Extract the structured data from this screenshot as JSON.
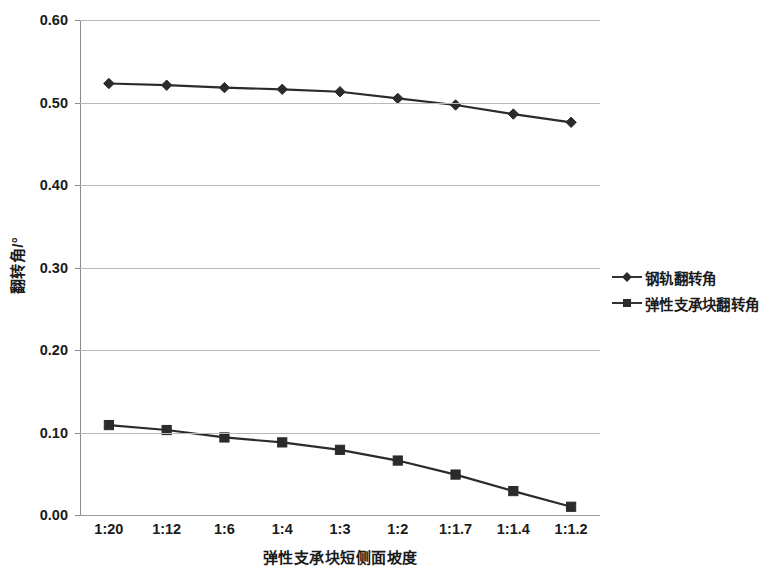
{
  "chart_data": {
    "type": "line",
    "title": "",
    "xlabel": "弹性支承块短侧面坡度",
    "ylabel": "翻转角/°",
    "categories": [
      "1:20",
      "1:12",
      "1:6",
      "1:4",
      "1:3",
      "1:2",
      "1:1.7",
      "1:1.4",
      "1:1.2"
    ],
    "ylim": [
      0.0,
      0.6
    ],
    "ytick_labels": [
      "0.00",
      "0.10",
      "0.20",
      "0.30",
      "0.40",
      "0.50",
      "0.60"
    ],
    "ytick_values": [
      0.0,
      0.1,
      0.2,
      0.3,
      0.4,
      0.5,
      0.6
    ],
    "grid": true,
    "legend_position": "right",
    "series": [
      {
        "name": "钢轨翻转角",
        "marker": "diamond",
        "color": "#2b2b2b",
        "values": [
          0.523,
          0.521,
          0.518,
          0.516,
          0.513,
          0.505,
          0.497,
          0.486,
          0.476
        ]
      },
      {
        "name": "弹性支承块翻转角",
        "marker": "square",
        "color": "#2b2b2b",
        "values": [
          0.109,
          0.103,
          0.094,
          0.088,
          0.079,
          0.066,
          0.049,
          0.029,
          0.01
        ]
      }
    ]
  },
  "legend": {
    "items": [
      {
        "label": "钢轨翻转角",
        "marker": "diamond"
      },
      {
        "label": "弹性支承块翻转角",
        "marker": "square"
      }
    ]
  }
}
